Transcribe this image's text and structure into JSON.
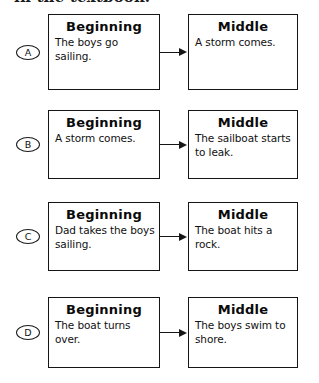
{
  "page": {
    "header_partial_text": "in the textbook."
  },
  "options": [
    {
      "letter": "A",
      "top": 14,
      "box_height": 76,
      "left_box": {
        "heading": "Beginning",
        "body": "The boys go sailing."
      },
      "right_box": {
        "heading": "Middle",
        "body": "A storm comes."
      }
    },
    {
      "letter": "B",
      "top": 110,
      "box_height": 69,
      "left_box": {
        "heading": "Beginning",
        "body": "A storm comes."
      },
      "right_box": {
        "heading": "Middle",
        "body": "The sailboat starts to leak."
      }
    },
    {
      "letter": "C",
      "top": 202,
      "box_height": 69,
      "left_box": {
        "heading": "Beginning",
        "body": "Dad takes the boys sailing."
      },
      "right_box": {
        "heading": "Middle",
        "body": "The boat hits a rock."
      }
    },
    {
      "letter": "D",
      "top": 297,
      "box_height": 71,
      "left_box": {
        "heading": "Beginning",
        "body": "The boat turns over."
      },
      "right_box": {
        "heading": "Middle",
        "body": "The boys swim to shore."
      }
    }
  ],
  "colors": {
    "ink": "#151515",
    "paper": "#ffffff"
  }
}
